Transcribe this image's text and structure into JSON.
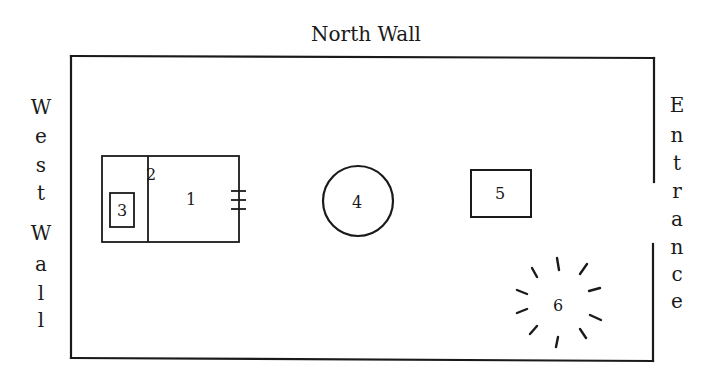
{
  "diagram": {
    "type": "floor-plan",
    "labels": {
      "north": "North Wall",
      "west_letters": [
        "W",
        "e",
        "s",
        "t",
        "W",
        "a",
        "l",
        "l"
      ],
      "east_letters": [
        "E",
        "n",
        "t",
        "r",
        "a",
        "n",
        "c",
        "e"
      ]
    },
    "colors": {
      "background": "#ffffff",
      "ink": "#1a1a1a"
    },
    "items": [
      {
        "id": "1",
        "label": "1",
        "shape": "rectangle"
      },
      {
        "id": "2",
        "label": "2",
        "shape": "rectangle"
      },
      {
        "id": "3",
        "label": "3",
        "shape": "small-rectangle"
      },
      {
        "id": "4",
        "label": "4",
        "shape": "circle"
      },
      {
        "id": "5",
        "label": "5",
        "shape": "rectangle"
      },
      {
        "id": "6",
        "label": "6",
        "shape": "starburst"
      }
    ]
  }
}
